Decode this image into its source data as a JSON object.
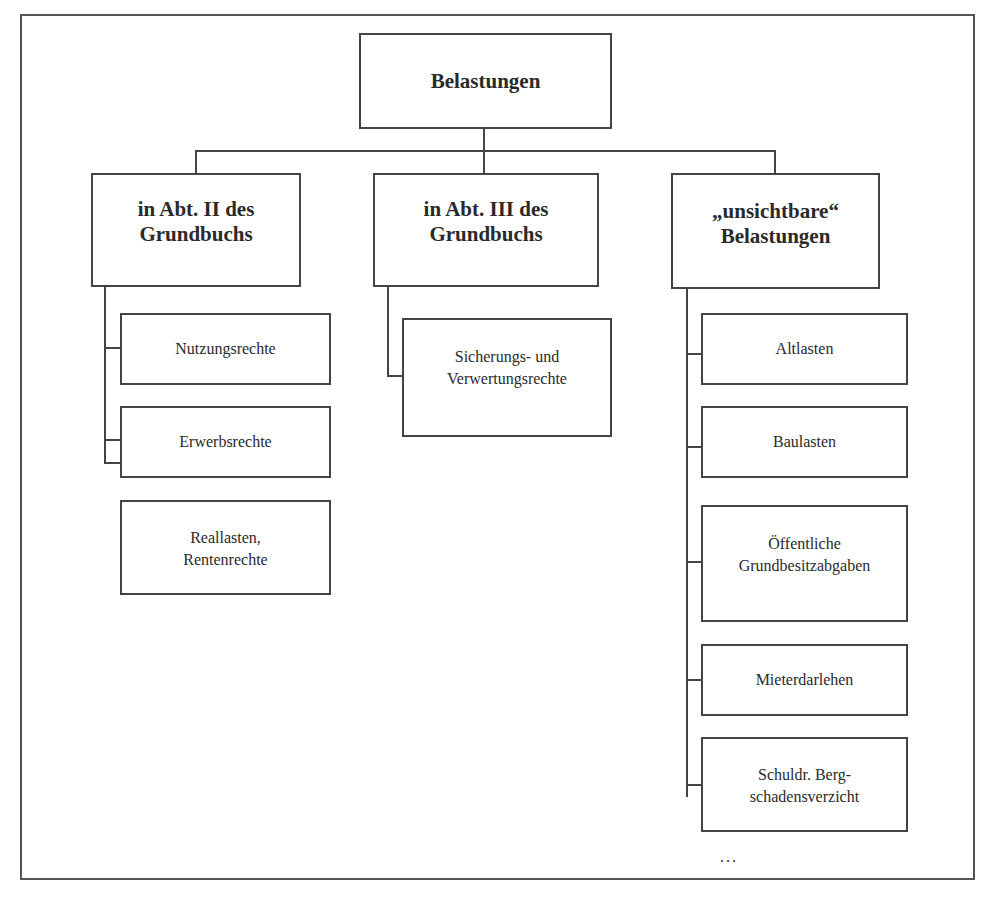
{
  "diagram": {
    "type": "tree",
    "root": {
      "label": "Belastungen"
    },
    "branches": [
      {
        "label": "in Abt. II des\nGrundbuchs",
        "children": [
          {
            "label": "Nutzungsrechte"
          },
          {
            "label": "Erwerbsrechte"
          },
          {
            "label": "Reallasten,\nRentenrechte"
          }
        ]
      },
      {
        "label": "in Abt. III des\nGrundbuchs",
        "children": [
          {
            "label": "Sicherungs- und\nVerwertungsrechte"
          }
        ]
      },
      {
        "label": "„unsichtbare“\nBelastungen",
        "children": [
          {
            "label": "Altlasten"
          },
          {
            "label": "Baulasten"
          },
          {
            "label": "Öffentliche\nGrundbesitzabgaben"
          },
          {
            "label": "Mieterdarlehen"
          },
          {
            "label": "Schuldr. Berg-\nschadensverzicht"
          }
        ],
        "continuation": "..."
      }
    ]
  }
}
